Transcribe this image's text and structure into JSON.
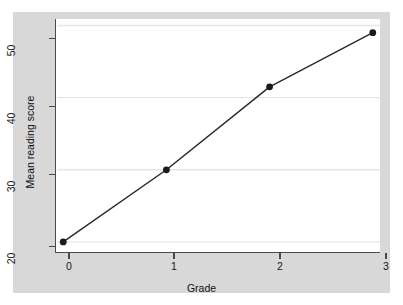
{
  "chart_data": {
    "type": "line",
    "title": "",
    "xlabel": "Grade",
    "ylabel": "Mean reading score",
    "x": [
      0,
      1,
      2,
      3
    ],
    "values": [
      20,
      30,
      41.5,
      49
    ],
    "series": [
      {
        "name": "Mean reading score",
        "x": [
          0,
          1,
          2,
          3
        ],
        "values": [
          20,
          30,
          41.5,
          49
        ]
      }
    ],
    "xticks": [
      0,
      1,
      2,
      3
    ],
    "xtick_labels": [
      "0",
      "1",
      "2",
      "3"
    ],
    "yticks": [
      20,
      30,
      40,
      50
    ],
    "ytick_labels": [
      "20",
      "30",
      "40",
      "50"
    ],
    "xlim": [
      -0.07,
      3.07
    ],
    "ylim": [
      18.6,
      50.9
    ],
    "grid": "horizontal",
    "legend": "none",
    "marker": "filled-circle",
    "line_color": "#2b2b2b",
    "marker_color": "#1a1a1a",
    "gridline_color": "#e6e6e6",
    "plot_background": "#ffffff",
    "canvas_background": "#d8d8d8",
    "axis_color": "#4a4a4a"
  },
  "axes": {
    "y_title": "Mean reading score",
    "x_title": "Grade",
    "y_tick_0": "20",
    "y_tick_1": "30",
    "y_tick_2": "40",
    "y_tick_3": "50",
    "x_tick_0": "0",
    "x_tick_1": "1",
    "x_tick_2": "2",
    "x_tick_3": "3"
  }
}
